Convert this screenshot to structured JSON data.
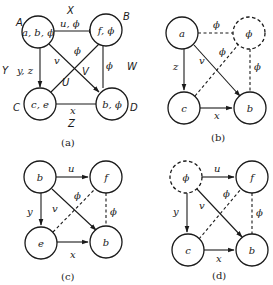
{
  "figure": {
    "panels": [
      {
        "caption": "(a)",
        "corner_labels": {
          "A": "A",
          "B": "B",
          "C": "C",
          "D": "D"
        },
        "side_labels": {
          "X": "X",
          "Y": "Y",
          "W": "W",
          "Z": "Z",
          "U": "U",
          "V": "V"
        },
        "nodes": [
          {
            "id": "A",
            "text": "a, b, ϕ",
            "style": "solid"
          },
          {
            "id": "B",
            "text": "f, ϕ",
            "style": "solid"
          },
          {
            "id": "C",
            "text": "c, e",
            "style": "solid"
          },
          {
            "id": "D",
            "text": "b, ϕ",
            "style": "solid"
          }
        ],
        "edges": [
          {
            "from": "A",
            "to": "B",
            "label": "u, ϕ",
            "style": "arrow"
          },
          {
            "from": "A",
            "to": "C",
            "label": "y, z",
            "style": "arrow"
          },
          {
            "from": "A",
            "to": "D",
            "label": "v",
            "style": "arrow"
          },
          {
            "from": "C",
            "to": "B",
            "label": "ϕ",
            "style": "line"
          },
          {
            "from": "B",
            "to": "D",
            "label": "ϕ",
            "style": "line"
          },
          {
            "from": "C",
            "to": "D",
            "label": "x",
            "style": "line"
          }
        ]
      },
      {
        "caption": "(b)",
        "nodes": [
          {
            "id": "TL",
            "text": "a",
            "style": "solid"
          },
          {
            "id": "TR",
            "text": "ϕ",
            "style": "dashed"
          },
          {
            "id": "BL",
            "text": "c",
            "style": "solid"
          },
          {
            "id": "BR",
            "text": "b",
            "style": "solid"
          }
        ],
        "edges": [
          {
            "from": "TL",
            "to": "TR",
            "label": "ϕ",
            "style": "dashed"
          },
          {
            "from": "TL",
            "to": "BL",
            "label": "z",
            "style": "arrow"
          },
          {
            "from": "TL",
            "to": "BR",
            "label": "v",
            "style": "arrow"
          },
          {
            "from": "BL",
            "to": "TR",
            "label": "ϕ",
            "style": "dashed"
          },
          {
            "from": "TR",
            "to": "BR",
            "label": "ϕ",
            "style": "dashed"
          },
          {
            "from": "BL",
            "to": "BR",
            "label": "x",
            "style": "arrow"
          }
        ]
      },
      {
        "caption": "(c)",
        "nodes": [
          {
            "id": "TL",
            "text": "b",
            "style": "solid"
          },
          {
            "id": "TR",
            "text": "f",
            "style": "solid"
          },
          {
            "id": "BL",
            "text": "e",
            "style": "solid"
          },
          {
            "id": "BR",
            "text": "b",
            "style": "solid"
          }
        ],
        "edges": [
          {
            "from": "TL",
            "to": "TR",
            "label": "u",
            "style": "arrow"
          },
          {
            "from": "TL",
            "to": "BL",
            "label": "y",
            "style": "arrow"
          },
          {
            "from": "TL",
            "to": "BR",
            "label": "v",
            "style": "arrow"
          },
          {
            "from": "BL",
            "to": "TR",
            "label": "ϕ",
            "style": "dashed"
          },
          {
            "from": "TR",
            "to": "BR",
            "label": "ϕ",
            "style": "dashed"
          },
          {
            "from": "BL",
            "to": "BR",
            "label": "x",
            "style": "arrow"
          }
        ]
      },
      {
        "caption": "(d)",
        "nodes": [
          {
            "id": "TL",
            "text": "ϕ",
            "style": "dashed"
          },
          {
            "id": "TR",
            "text": "f",
            "style": "solid"
          },
          {
            "id": "BL",
            "text": "c",
            "style": "solid"
          },
          {
            "id": "BR",
            "text": "b",
            "style": "solid"
          }
        ],
        "edges": [
          {
            "from": "TL",
            "to": "TR",
            "label": "u",
            "style": "arrow"
          },
          {
            "from": "TL",
            "to": "BL",
            "label": "y",
            "style": "arrow"
          },
          {
            "from": "TL",
            "to": "BR",
            "label": "v",
            "style": "arrow"
          },
          {
            "from": "BL",
            "to": "TR",
            "label": "ϕ",
            "style": "dashed"
          },
          {
            "from": "TR",
            "to": "BR",
            "label": "ϕ",
            "style": "dashed"
          },
          {
            "from": "BL",
            "to": "BR",
            "label": "x",
            "style": "arrow"
          }
        ]
      }
    ]
  }
}
